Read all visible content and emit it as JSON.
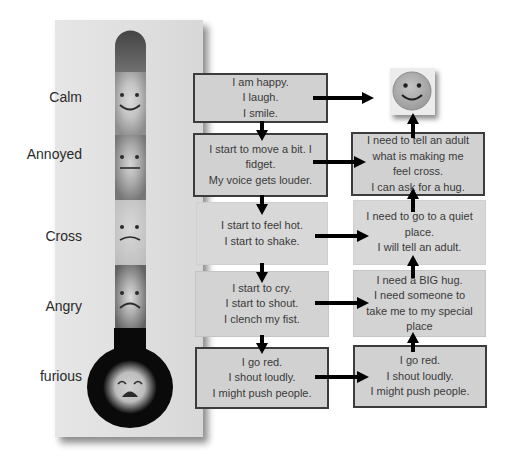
{
  "scale": {
    "levels": [
      {
        "label": "Calm",
        "face": "smile-face-icon"
      },
      {
        "label": "Annoyed",
        "face": "neutral-face-icon"
      },
      {
        "label": "Cross",
        "face": "frown-face-icon"
      },
      {
        "label": "Angry",
        "face": "sad-face-icon"
      },
      {
        "label": "furious",
        "face": "furious-face-icon"
      }
    ]
  },
  "feelings": [
    {
      "lines": [
        "I am happy.",
        "I laugh.",
        "I smile."
      ]
    },
    {
      "lines": [
        "I start to move a bit. I",
        "fidget.",
        "My voice gets louder."
      ]
    },
    {
      "lines": [
        "I start to feel hot.",
        "I start to shake."
      ]
    },
    {
      "lines": [
        "I start to cry.",
        "I start to shout.",
        "I clench my fist."
      ]
    },
    {
      "lines": [
        "I go red.",
        "I shout loudly.",
        "I might push people."
      ]
    }
  ],
  "actions": {
    "goal_icon": "smiley-face-icon",
    "boxes": [
      {
        "lines": [
          "I need to tell an adult",
          "what is making me",
          "feel cross.",
          "I can ask for a hug."
        ]
      },
      {
        "lines": [
          "I need to go to a quiet",
          "place.",
          "I will tell an adult."
        ]
      },
      {
        "lines": [
          "I need a BIG hug.",
          "I need someone to",
          "take me to my special",
          "place"
        ]
      },
      {
        "lines": [
          "I go red.",
          "I shout loudly.",
          "I might push people."
        ]
      }
    ]
  },
  "colors": {
    "panel": "#e0e0e0",
    "box_fill": "#d1d1d1",
    "box_border": "#3c3c3c",
    "arrow": "#000000",
    "bulb": "#0a0a0a"
  }
}
